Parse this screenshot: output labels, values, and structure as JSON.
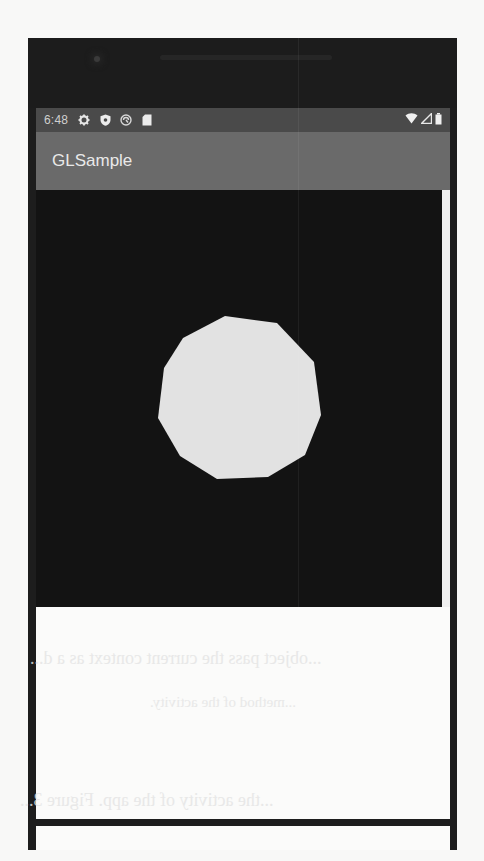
{
  "status_bar": {
    "time": "6:48",
    "left_icons": [
      "settings-icon",
      "shield-icon",
      "sync-icon",
      "sd-card-icon"
    ],
    "right_icons": [
      "wifi-icon",
      "cellular-signal-icon",
      "battery-icon"
    ]
  },
  "app_bar": {
    "title": "GLSample"
  },
  "gl_view": {
    "background_color": "#131313",
    "shape": "polygon",
    "shape_color": "#e2e2e2",
    "vertices": [
      [
        189,
        126
      ],
      [
        241,
        133
      ],
      [
        278,
        172
      ],
      [
        285,
        225
      ],
      [
        269,
        265
      ],
      [
        232,
        287
      ],
      [
        181,
        289
      ],
      [
        144,
        266
      ],
      [
        122,
        228
      ],
      [
        128,
        178
      ],
      [
        147,
        148
      ]
    ]
  },
  "colors": {
    "status_bar": "#4a4a4a",
    "app_bar": "#6a6a6a",
    "frame": "#1d1d1d",
    "lower_area": "#fbfbfa"
  },
  "bleed_through_text": {
    "line1": "...object pass the current context as a d...",
    "line2": "...method of the activity.",
    "line3": "...the activity of the app. Figure 3..."
  }
}
